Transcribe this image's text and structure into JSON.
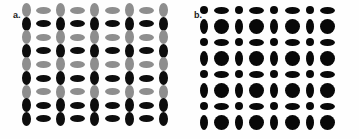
{
  "figure": {
    "background_color": "#fefefe",
    "width": 359,
    "height": 139,
    "panels": [
      {
        "id": "a",
        "label": "a.",
        "label_x": 13,
        "label_y": 11,
        "description": "Alternating vertical and horizontal ellipses on a grid, with rows alternating between light gray and black fill",
        "origin_x": 26,
        "origin_y": 10,
        "cell_w": 17.2,
        "cell_h": 13.6,
        "cols": 9,
        "rows": 9,
        "colors": {
          "light": "#8e8e8e",
          "dark": "#0d0d0d"
        },
        "shape_sizes": {
          "vertical_w": 9,
          "vertical_h": 14,
          "horizontal_w": 15,
          "horizontal_h": 7
        }
      },
      {
        "id": "b",
        "label": "b.",
        "label_x": 14,
        "label_y": 11,
        "description": "All-black ellipses on a grid alternating between small and large, vertical and horizontal orientation",
        "origin_x": 24,
        "origin_y": 10,
        "cell_w": 17.6,
        "cell_h": 16.0,
        "cols": 8,
        "rows": 8,
        "colors": {
          "dark": "#080808"
        },
        "shape_sizes": {
          "small_round_w": 8,
          "small_round_h": 8,
          "small_vertical_w": 7,
          "small_vertical_h": 14,
          "small_horizontal_w": 15,
          "small_horizontal_h": 7,
          "large_round_w": 15,
          "large_round_h": 15
        }
      }
    ]
  },
  "chart_data": {
    "type": "heatmap",
    "title": "",
    "subtitle": "",
    "xlabel": "",
    "ylabel": "",
    "grid": false,
    "legend_position": "none",
    "panel_labels": [
      "a.",
      "b."
    ],
    "panel_a": {
      "note": "9x9 lattice. Column parity sets orientation (even col = vertical ellipse, odd col = horizontal ellipse). Row parity sets value (even row = light gray 0.45, odd row = black 1.0).",
      "cols": 9,
      "rows": 9,
      "orientation_by_col": [
        "vertical",
        "horizontal",
        "vertical",
        "horizontal",
        "vertical",
        "horizontal",
        "vertical",
        "horizontal",
        "vertical"
      ],
      "value_by_row": [
        0.45,
        1.0,
        0.45,
        1.0,
        0.45,
        1.0,
        0.45,
        1.0,
        1.0
      ],
      "color_for_value": {
        "0.45": "#8e8e8e",
        "1.0": "#0d0d0d"
      }
    },
    "panel_b": {
      "note": "8x8 lattice, all elements black. Size alternates small/large by row+col parity; orientation alternates vertical/horizontal.",
      "cols": 8,
      "rows": 8,
      "size_by_row": [
        "small",
        "large",
        "small",
        "large",
        "small",
        "large",
        "small",
        "large"
      ],
      "orientation_by_col": [
        "vertical",
        "horizontal",
        "vertical",
        "horizontal",
        "vertical",
        "horizontal",
        "vertical",
        "horizontal"
      ],
      "value": 1.0,
      "color_for_value": {
        "1.0": "#080808"
      }
    }
  }
}
